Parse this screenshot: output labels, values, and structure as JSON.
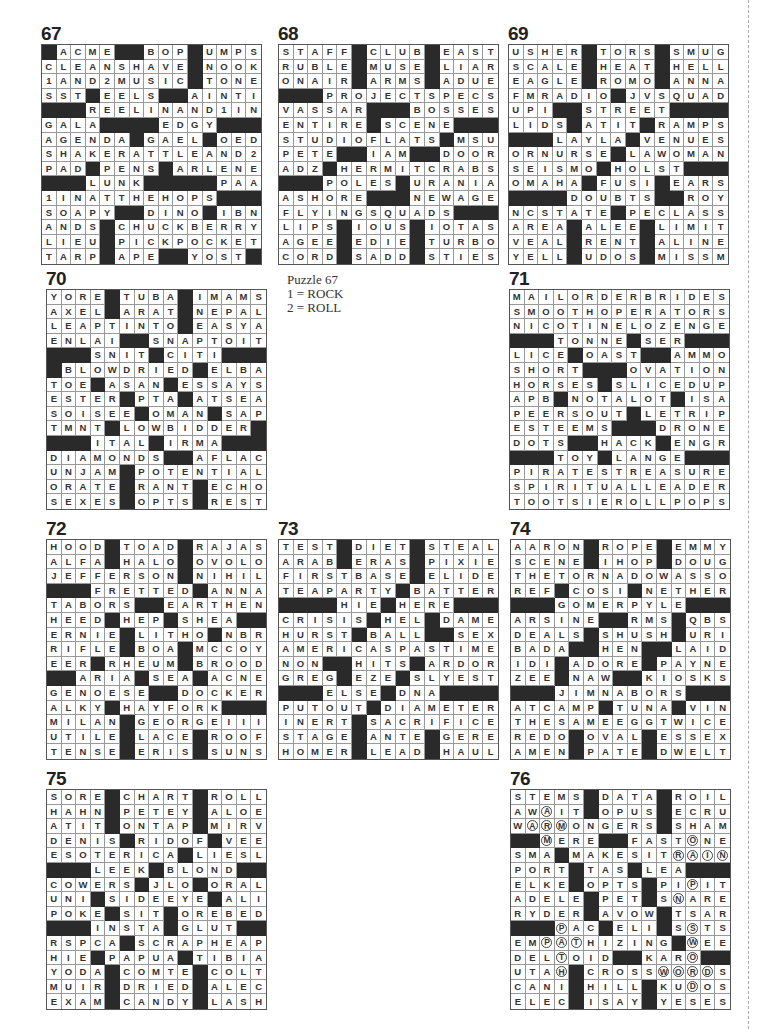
{
  "note": {
    "title": "Puzzle 67",
    "lines": [
      "1 = ROCK",
      "2 = ROLL"
    ]
  },
  "puzzles": [
    {
      "number": "67",
      "left": 41,
      "top": 24,
      "rows": [
        "#ACME##BOP#UMPS",
        "CLEANSHAVE#NOOK",
        "1AND2MUSIC#TONE",
        "SST#EELS##AINTI",
        "###REELINAND1IN",
        "GALA####EDGY###",
        "AGENDA#GAEL#OED",
        "SHAKERATTLEAND2",
        "PAD#PENS#ARLENE",
        "###LUNK#####PAAR",
        "1INATTHEHOPS###",
        "SOAPY##DINO#IBN",
        "ANDS#CHUCKBERRY",
        "LIEU#PICKPOCKET",
        "TARP#APE##YOST#"
      ]
    },
    {
      "number": "68",
      "left": 278,
      "top": 24,
      "rows": [
        "STAFF#CLUB#EAST",
        "RUBLE#MUSE#LIAR",
        "ONAIR#ARMS#ADUE",
        "###PROJECTSPECS",
        "VASSAR###BOSSES",
        "ENTIRE#SCENE###",
        "STUDIOFLATS#MSU",
        "PETE##IAM##DOOR",
        "ADZ#HERMITCRABS",
        "###POLES#URANIA",
        "ASHORE###NEWAGE",
        "FLYINGSQUADS###",
        "LIPS#IOUS#IOTAS",
        "AGEE#EDIE#TURBO",
        "CORD#SADD#STIES"
      ]
    },
    {
      "number": "69",
      "left": 508,
      "top": 24,
      "rows": [
        "USHER#TORS#SMUG",
        "SCALE#HEAT#HELL",
        "EAGLE#ROMO#ANNA",
        "FMRADIO#JVSQUAD",
        "UPI##STREET####",
        "LIDS#ATIT#RAMPS",
        "###LAYLA#VENUES",
        "ORNURSE#LAWOMAN",
        "SEISMO#HOLST###",
        "OMAHA#FUSI#EARS",
        "####DOUBTS##ROY",
        "NCSTATE#PECLASS",
        "AREA#ALEE#LIMIT",
        "VEAL#RENT#ALINE",
        "YELL#UDOS#MISSM"
      ]
    },
    {
      "number": "70",
      "left": 46,
      "top": 269,
      "rows": [
        "YORE#TUBA#IMAMS",
        "AXEL#ARAT#NEPAL",
        "LEAPTINTO#EASYA",
        "ENLAI##SNAPTOIT",
        "###SNIT#CITI###",
        "#BLOWDRIED#ELBA",
        "TOE#ASAN#ESSAYS",
        "ESTER#PTA#ATSEA",
        "SOISEE#OMAN#SAP",
        "TMNT#LOWBIDDER#",
        "###ITAL#IRMA###",
        "DIAMONDS##AFLAC",
        "UNJAM#POTENTIAL",
        "ORATE#RANT#ECHO",
        "SEXES#OPTS#REST"
      ]
    },
    {
      "number": "71",
      "left": 509,
      "top": 269,
      "rows": [
        "MAILORDERBRIDES",
        "SMOOTHOPERATORS",
        "NICOTINELOZENGE",
        "###TONNE#SER###",
        "LICE#OAST##AMMO",
        "SHORT###OVATION",
        "HORSES#SLICEDUP",
        "APB#NOTALOT#ISA",
        "PEERSOUT#LETRIP",
        "ESTEEMS###DRONE",
        "DOTS##HACK#ENGR",
        "###TOY#LANGE###",
        "PIRATESTREASURE",
        "SPIRITUALLEADER",
        "TOOTSIEROLLPOPS"
      ]
    },
    {
      "number": "72",
      "left": 46,
      "top": 519,
      "rows": [
        "HOOD#TOAD#RAJAS",
        "ALFA#HALO#OVOLO",
        "JEFFERSON#NIHIL",
        "###FRETTED#ANNA",
        "TABORS##EARTHEN",
        "HEED#HEP#SHEA##",
        "ERNIE#LITHO#NBR",
        "RIFLE#BOA#MCCOY",
        "EER#RHEUM#BROOD",
        "##ARIA#SEA#ACNE",
        "GENOESE##DOCKER",
        "ALKY#HAYFORK###",
        "MILAN#GEORGEIII",
        "UTILE#LACE#ROOF",
        "TENSE#ERIS#SUNS"
      ]
    },
    {
      "number": "73",
      "left": 278,
      "top": 519,
      "rows": [
        "TEST#DIET#STEAL",
        "ARAB#ERAS#PIXIE",
        "FIRSTBASE#ELIDE",
        "TEAPARTY#BATTER",
        "####HIE#HERE###",
        "CRISIS#HEL#DAME",
        "HURST#BALL##SEX",
        "AMERICASPASTIME",
        "NON##HITS#ARDOR",
        "GREG#EZE#SLYEST",
        "###ELSE#DNA####",
        "PUTOUT#DIAMETER",
        "INERT#SACRIFICE",
        "STAGE#ANTE#GERE",
        "HOMER#LEAD#HAUL"
      ]
    },
    {
      "number": "74",
      "left": 510,
      "top": 519,
      "rows": [
        "AARON#ROPE#EMMY",
        "SCENE#IHOP#DOUG",
        "THETORNADOWASSO",
        "REF#COSI#NETHER",
        "###GOMERPYLE###",
        "ARSINE##RMS#QBS",
        "DEALS#SHUSH#URI",
        "BADA##HEN##LAID",
        "IDI#ADORE#PAYNE",
        "ZEE#NAW##KIOSKS",
        "###JIMNABORS###",
        "ATCAMP#TUNA#VIN",
        "THESAMEEGGTWICE",
        "REDO#OVAL#ESSEX",
        "AMEN#PATE#DWELT"
      ]
    },
    {
      "number": "75",
      "left": 46,
      "top": 769,
      "rows": [
        "SORE#CHART#ROLL",
        "HAHN#PETEY#ALOE",
        "ATIT#ONTAP#MIRV",
        "DENIS#RIDOF#VEE",
        "ESOTERICA#LIESL",
        "###LEEK#BLOND##",
        "COWERS#JLO#ORAL",
        "UNI#SIDEEYE#ALI",
        "POKE#SIT#OREBED",
        "###INSTA#GLUT###",
        "RSPCA#SCRAPHEAP",
        "HIE#PAPUA#TIBIA",
        "YODA#COMTE#COLT",
        "MUIR#DRIED#ALEC",
        "EXAM#CANDY#LASH"
      ]
    },
    {
      "number": "76",
      "left": 510,
      "top": 769,
      "rows": [
        "STEMS#DATA#ROIL",
        "AWAIT#OPUS#ECRU",
        "WARMONGERS#SHAM",
        "##MERE##FASTONE",
        "SMA#MAKESITRAIN",
        "PORT#TAS#LEA###",
        "ELKE#OPTS#PIPIT",
        "ADELE#PET#SNARE",
        "RYDER#AVOW#TSAR",
        "###PAC#ELI#SSTS",
        "EMPATHIZING#WEE",
        "DELTOID##KARO##",
        "UTAH#CROSSWORDS",
        "CANI#HILL#KUDOS",
        "ELEC#ISAY#YESES"
      ],
      "circled": [
        [
          1,
          2
        ],
        [
          2,
          1
        ],
        [
          2,
          2
        ],
        [
          2,
          3
        ],
        [
          3,
          2
        ],
        [
          3,
          12
        ],
        [
          4,
          11
        ],
        [
          4,
          12
        ],
        [
          4,
          13
        ],
        [
          4,
          14
        ],
        [
          5,
          12
        ],
        [
          6,
          12
        ],
        [
          7,
          11
        ],
        [
          9,
          3
        ],
        [
          9,
          12
        ],
        [
          10,
          2
        ],
        [
          10,
          3
        ],
        [
          10,
          4
        ],
        [
          10,
          12
        ],
        [
          11,
          3
        ],
        [
          11,
          12
        ],
        [
          12,
          3
        ],
        [
          12,
          10
        ],
        [
          12,
          11
        ],
        [
          12,
          12
        ],
        [
          12,
          13
        ],
        [
          13,
          12
        ]
      ]
    }
  ]
}
